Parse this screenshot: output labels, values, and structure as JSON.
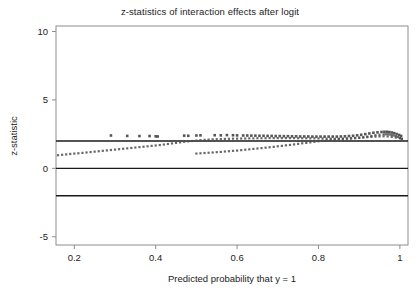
{
  "chart_data": {
    "type": "scatter",
    "title": "z-statistics of interaction effects after logit",
    "xlabel": "Predicted probability that y = 1",
    "ylabel": "z-statistic",
    "xlim": [
      0.155,
      1.02
    ],
    "ylim": [
      -5.6,
      10.4
    ],
    "xticks": [
      0.2,
      0.4,
      0.6,
      0.8,
      1
    ],
    "xtick_labels": [
      "0.2",
      "0.4",
      "0.6",
      "0.8",
      "1"
    ],
    "yticks": [
      -5,
      0,
      5,
      10
    ],
    "ytick_labels": [
      "-5",
      "0",
      "5",
      "10"
    ],
    "grid": false,
    "legend": false,
    "marker_color": "#4d4d4d",
    "reference_line_color": "#1a1a1a",
    "frame_color": "#8c8c8c",
    "reference_lines": [
      {
        "name": "upper-critical-value",
        "y": 2
      },
      {
        "name": "zero-line",
        "y": 0
      },
      {
        "name": "lower-critical-value",
        "y": -2
      }
    ],
    "series": [
      {
        "name": "upper-band",
        "note": "dense lower-left to mid band rising from ~1.0 to ~2.2",
        "points": [
          [
            0.16,
            0.96
          ],
          [
            0.17,
            0.99
          ],
          [
            0.18,
            1.02
          ],
          [
            0.19,
            1.05
          ],
          [
            0.2,
            1.08
          ],
          [
            0.21,
            1.1
          ],
          [
            0.22,
            1.13
          ],
          [
            0.23,
            1.16
          ],
          [
            0.24,
            1.19
          ],
          [
            0.25,
            1.22
          ],
          [
            0.26,
            1.25
          ],
          [
            0.27,
            1.28
          ],
          [
            0.28,
            1.31
          ],
          [
            0.29,
            1.34
          ],
          [
            0.3,
            1.37
          ],
          [
            0.31,
            1.4
          ],
          [
            0.32,
            1.43
          ],
          [
            0.33,
            1.46
          ],
          [
            0.34,
            1.49
          ],
          [
            0.35,
            1.52
          ],
          [
            0.36,
            1.55
          ],
          [
            0.37,
            1.58
          ],
          [
            0.38,
            1.61
          ],
          [
            0.39,
            1.64
          ],
          [
            0.4,
            1.67
          ],
          [
            0.41,
            1.7
          ],
          [
            0.42,
            1.74
          ],
          [
            0.43,
            1.78
          ],
          [
            0.44,
            1.82
          ],
          [
            0.45,
            1.86
          ],
          [
            0.46,
            1.9
          ],
          [
            0.47,
            1.94
          ],
          [
            0.48,
            1.97
          ],
          [
            0.49,
            2.0
          ],
          [
            0.5,
            2.03
          ],
          [
            0.51,
            2.06
          ],
          [
            0.52,
            2.08
          ],
          [
            0.53,
            2.1
          ],
          [
            0.54,
            2.12
          ],
          [
            0.55,
            2.13
          ],
          [
            0.56,
            2.14
          ],
          [
            0.57,
            2.15
          ],
          [
            0.58,
            2.16
          ],
          [
            0.59,
            2.17
          ],
          [
            0.6,
            2.17
          ],
          [
            0.61,
            2.18
          ],
          [
            0.62,
            2.18
          ],
          [
            0.63,
            2.19
          ],
          [
            0.64,
            2.19
          ],
          [
            0.65,
            2.2
          ],
          [
            0.66,
            2.2
          ],
          [
            0.67,
            2.2
          ],
          [
            0.68,
            2.21
          ],
          [
            0.69,
            2.21
          ],
          [
            0.7,
            2.21
          ],
          [
            0.71,
            2.21
          ],
          [
            0.72,
            2.21
          ],
          [
            0.73,
            2.21
          ],
          [
            0.74,
            2.21
          ],
          [
            0.75,
            2.2
          ],
          [
            0.76,
            2.2
          ],
          [
            0.77,
            2.2
          ],
          [
            0.78,
            2.19
          ],
          [
            0.79,
            2.19
          ],
          [
            0.8,
            2.18
          ],
          [
            0.81,
            2.18
          ],
          [
            0.82,
            2.17
          ],
          [
            0.83,
            2.17
          ],
          [
            0.84,
            2.16
          ],
          [
            0.85,
            2.16
          ],
          [
            0.86,
            2.16
          ],
          [
            0.87,
            2.17
          ],
          [
            0.88,
            2.18
          ],
          [
            0.89,
            2.2
          ],
          [
            0.9,
            2.23
          ],
          [
            0.91,
            2.27
          ],
          [
            0.92,
            2.32
          ],
          [
            0.93,
            2.37
          ],
          [
            0.94,
            2.42
          ],
          [
            0.95,
            2.46
          ],
          [
            0.96,
            2.48
          ],
          [
            0.965,
            2.49
          ],
          [
            0.97,
            2.49
          ],
          [
            0.975,
            2.47
          ],
          [
            0.98,
            2.44
          ],
          [
            0.985,
            2.4
          ],
          [
            0.99,
            2.35
          ],
          [
            0.995,
            2.29
          ],
          [
            1.0,
            2.23
          ],
          [
            1.005,
            2.17
          ]
        ]
      },
      {
        "name": "lower-band",
        "note": "second cluster starting near x=0.50 at z~1.1 rising to merge at right",
        "points": [
          [
            0.5,
            1.08
          ],
          [
            0.51,
            1.1
          ],
          [
            0.52,
            1.12
          ],
          [
            0.53,
            1.14
          ],
          [
            0.54,
            1.16
          ],
          [
            0.55,
            1.18
          ],
          [
            0.56,
            1.2
          ],
          [
            0.57,
            1.23
          ],
          [
            0.58,
            1.25
          ],
          [
            0.59,
            1.28
          ],
          [
            0.6,
            1.3
          ],
          [
            0.61,
            1.33
          ],
          [
            0.62,
            1.36
          ],
          [
            0.63,
            1.39
          ],
          [
            0.64,
            1.42
          ],
          [
            0.65,
            1.45
          ],
          [
            0.66,
            1.48
          ],
          [
            0.67,
            1.51
          ],
          [
            0.68,
            1.54
          ],
          [
            0.69,
            1.57
          ],
          [
            0.7,
            1.61
          ],
          [
            0.71,
            1.64
          ],
          [
            0.72,
            1.68
          ],
          [
            0.73,
            1.71
          ],
          [
            0.74,
            1.75
          ],
          [
            0.75,
            1.79
          ],
          [
            0.76,
            1.83
          ],
          [
            0.77,
            1.86
          ],
          [
            0.78,
            1.9
          ],
          [
            0.79,
            1.94
          ],
          [
            0.8,
            1.98
          ],
          [
            0.81,
            2.01
          ],
          [
            0.82,
            2.05
          ],
          [
            0.83,
            2.08
          ],
          [
            0.84,
            2.11
          ],
          [
            0.85,
            2.14
          ],
          [
            0.86,
            2.16
          ],
          [
            0.87,
            2.18
          ],
          [
            0.88,
            2.2
          ],
          [
            0.89,
            2.22
          ],
          [
            0.9,
            2.24
          ],
          [
            0.91,
            2.26
          ],
          [
            0.92,
            2.28
          ],
          [
            0.93,
            2.3
          ],
          [
            0.94,
            2.32
          ],
          [
            0.95,
            2.33
          ],
          [
            0.96,
            2.34
          ],
          [
            0.97,
            2.33
          ],
          [
            0.98,
            2.3
          ],
          [
            0.99,
            2.25
          ],
          [
            1.0,
            2.19
          ],
          [
            1.005,
            2.14
          ]
        ]
      },
      {
        "name": "upper-sparse-markers",
        "note": "isolated larger square markers above the dense band",
        "points": [
          [
            0.29,
            2.4
          ],
          [
            0.33,
            2.37
          ],
          [
            0.36,
            2.36
          ],
          [
            0.385,
            2.36
          ],
          [
            0.4,
            2.34
          ],
          [
            0.405,
            2.33
          ],
          [
            0.47,
            2.39
          ],
          [
            0.48,
            2.38
          ],
          [
            0.5,
            2.4
          ],
          [
            0.51,
            2.41
          ],
          [
            0.545,
            2.42
          ],
          [
            0.56,
            2.41
          ],
          [
            0.575,
            2.43
          ],
          [
            0.59,
            2.42
          ],
          [
            0.6,
            2.41
          ],
          [
            0.615,
            2.4
          ],
          [
            0.625,
            2.4
          ],
          [
            0.635,
            2.39
          ],
          [
            0.645,
            2.39
          ],
          [
            0.655,
            2.38
          ],
          [
            0.665,
            2.38
          ],
          [
            0.675,
            2.37
          ],
          [
            0.685,
            2.37
          ],
          [
            0.695,
            2.36
          ],
          [
            0.705,
            2.36
          ],
          [
            0.715,
            2.35
          ],
          [
            0.725,
            2.35
          ],
          [
            0.735,
            2.34
          ],
          [
            0.745,
            2.34
          ],
          [
            0.755,
            2.33
          ],
          [
            0.765,
            2.33
          ],
          [
            0.775,
            2.33
          ],
          [
            0.785,
            2.32
          ],
          [
            0.795,
            2.32
          ],
          [
            0.805,
            2.32
          ],
          [
            0.815,
            2.32
          ],
          [
            0.825,
            2.32
          ],
          [
            0.835,
            2.32
          ],
          [
            0.845,
            2.32
          ],
          [
            0.855,
            2.33
          ],
          [
            0.865,
            2.34
          ],
          [
            0.875,
            2.36
          ],
          [
            0.885,
            2.38
          ],
          [
            0.895,
            2.41
          ],
          [
            0.905,
            2.45
          ],
          [
            0.915,
            2.5
          ],
          [
            0.925,
            2.55
          ],
          [
            0.935,
            2.6
          ],
          [
            0.945,
            2.63
          ],
          [
            0.955,
            2.66
          ],
          [
            0.962,
            2.67
          ],
          [
            0.968,
            2.67
          ],
          [
            0.974,
            2.65
          ],
          [
            0.98,
            2.62
          ],
          [
            0.986,
            2.57
          ],
          [
            0.992,
            2.51
          ],
          [
            0.998,
            2.44
          ],
          [
            1.003,
            2.37
          ]
        ]
      }
    ]
  }
}
